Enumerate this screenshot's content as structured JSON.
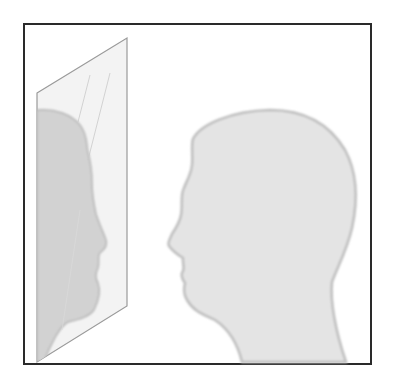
{
  "illustration": {
    "subject": "person-looking-in-mirror",
    "colors": {
      "frame": "#2a2a2a",
      "head_fill": "#e4e4e4",
      "head_edge": "#bdbdbd",
      "mirror_fill": "#f3f3f3",
      "mirror_edge": "#9a9a9a",
      "reflection_fill": "#d2d2d2",
      "glare": "#c9c9c9"
    }
  }
}
